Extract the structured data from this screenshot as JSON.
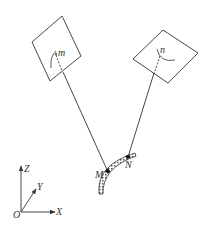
{
  "diagram": {
    "colors": {
      "stroke": "#333333",
      "background": "#ffffff",
      "tube_fill": "#bbbbbb"
    },
    "planes": [
      {
        "id": "left-plane",
        "point_label": "m"
      },
      {
        "id": "right-plane",
        "point_label": "n"
      }
    ],
    "tube_points": {
      "M": "M",
      "N": "N"
    },
    "axes": {
      "origin": "O",
      "x": "X",
      "y": "Y",
      "z": "Z"
    }
  }
}
